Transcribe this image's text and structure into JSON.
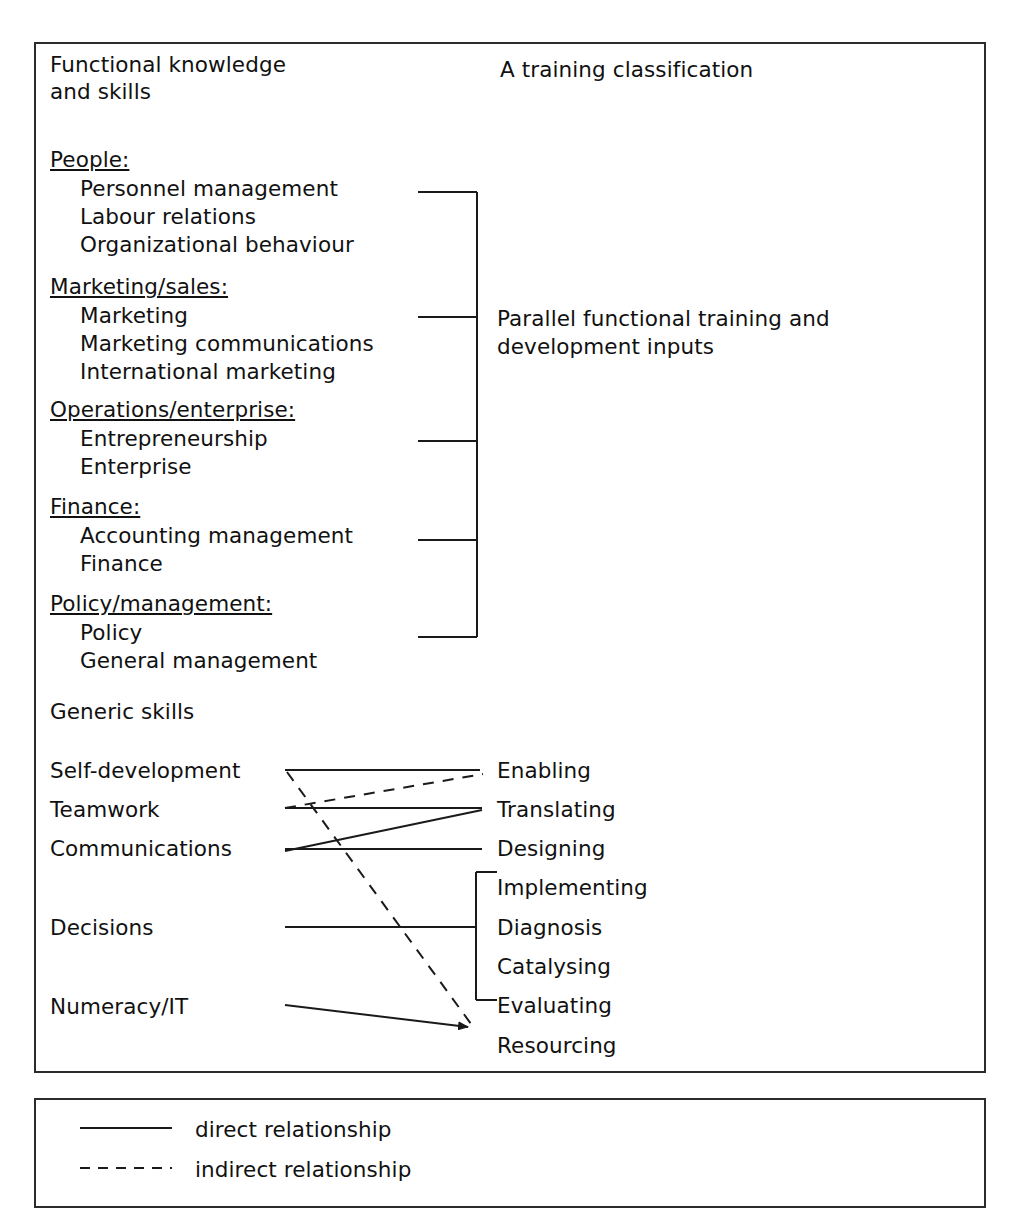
{
  "diagram": {
    "title": "A training classification",
    "left_heading_line1": "Functional knowledge",
    "left_heading_line2": "and skills",
    "generic_heading": "Generic skills",
    "bracket_note_line1": "Parallel functional training and",
    "bracket_note_line2": "development inputs"
  },
  "functional": {
    "groups": [
      {
        "category": "People:",
        "items": [
          "Personnel management",
          "Labour relations",
          "Organizational behaviour"
        ]
      },
      {
        "category": "Marketing/sales:",
        "items": [
          "Marketing",
          "Marketing communications",
          "International marketing"
        ]
      },
      {
        "category": "Operations/enterprise:",
        "items": [
          "Entrepreneurship",
          "Enterprise"
        ]
      },
      {
        "category": "Finance:",
        "items": [
          "Accounting management",
          "Finance"
        ]
      },
      {
        "category": "Policy/management:",
        "items": [
          "Policy",
          "General management"
        ]
      }
    ]
  },
  "generic_skills": {
    "left_items": [
      "Self-development",
      "Teamwork",
      "Communications",
      "Decisions",
      "Numeracy/IT"
    ],
    "right_items": [
      "Enabling",
      "Translating",
      "Designing",
      "Implementing",
      "Diagnosis",
      "Catalysing",
      "Evaluating",
      "Resourcing"
    ]
  },
  "legend": {
    "entries": [
      {
        "style": "solid",
        "label": "direct relationship"
      },
      {
        "style": "dashed",
        "label": "indirect relationship"
      }
    ]
  },
  "colors": {
    "ink": "#1a1a1a",
    "frame": "#2b2b2b",
    "background": "#ffffff"
  }
}
